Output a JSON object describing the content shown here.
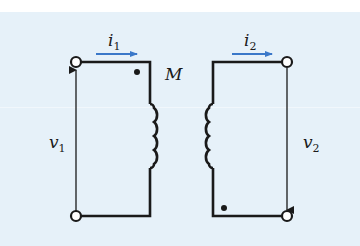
{
  "diagram": {
    "mutual_label": "M",
    "primary": {
      "current_label": "i",
      "current_sub": "1",
      "voltage_label": "v",
      "voltage_sub": "1",
      "dot_position": "top"
    },
    "secondary": {
      "current_label": "i",
      "current_sub": "2",
      "voltage_label": "v",
      "voltage_sub": "2",
      "dot_position": "bottom"
    },
    "colors": {
      "wire": "#1a1a1a",
      "current_arrow": "#3a78c9",
      "background": "#e6f1f9"
    }
  }
}
